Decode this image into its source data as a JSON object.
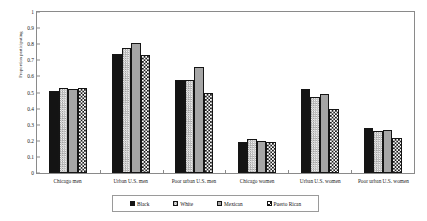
{
  "chart_data": {
    "type": "bar",
    "title": "",
    "subtitle": "",
    "xlabel": "",
    "ylabel": "Proportion participating",
    "ylim": [
      0,
      1
    ],
    "yticks": [
      "0",
      "0.1",
      "0.2",
      "0.3",
      "0.4",
      "0.5",
      "0.6",
      "0.7",
      "0.8",
      "0.9",
      "1"
    ],
    "grid": false,
    "legend_position": "bottom",
    "categories": [
      "Chicago men",
      "Urban U.S. men",
      "Poor urban U.S. men",
      "Chicago women",
      "Urban U.S. women",
      "Poor urban U.S. women"
    ],
    "series": [
      {
        "name": "Black",
        "pattern": "solid-black",
        "color": "#141414",
        "values": [
          0.51,
          0.74,
          0.58,
          0.195,
          0.52,
          0.28
        ]
      },
      {
        "name": "White",
        "pattern": "fine-checker",
        "color": "#d2d2d2",
        "values": [
          0.53,
          0.775,
          0.575,
          0.21,
          0.475,
          0.26
        ]
      },
      {
        "name": "Mexican",
        "pattern": "solid-gray",
        "color": "#a6a6a6",
        "values": [
          0.52,
          0.81,
          0.66,
          0.2,
          0.49,
          0.27
        ]
      },
      {
        "name": "Puerto Rican",
        "pattern": "bold-checker",
        "color": "#ffffff",
        "values": [
          0.53,
          0.73,
          0.5,
          0.195,
          0.4,
          0.215
        ]
      }
    ]
  },
  "legend": {
    "items": [
      {
        "label": "Black"
      },
      {
        "label": "White"
      },
      {
        "label": "Mexican"
      },
      {
        "label": "Puerto Rican"
      }
    ]
  }
}
